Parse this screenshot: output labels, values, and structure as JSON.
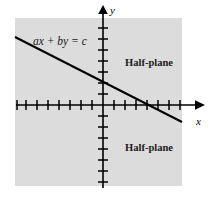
{
  "figure": {
    "type": "math-diagram",
    "background_color": "#ffffff",
    "shaded_color": "#dcdcdc",
    "ink_color": "#000000"
  },
  "labels": {
    "equation": "ax + by = c",
    "x_axis": "x",
    "y_axis": "y",
    "half_plane_upper": "Half-plane",
    "half_plane_lower": "Half-plane"
  },
  "chart_data": {
    "type": "line",
    "title": "",
    "xlabel": "x",
    "ylabel": "y",
    "grid": false,
    "legend": "none",
    "xlim": [
      -8,
      7.5
    ],
    "ylim": [
      -8,
      8
    ],
    "origin_px": [
      103,
      105
    ],
    "tick_spacing_px": 11,
    "x_ticks_left": 8,
    "x_ticks_right": 7,
    "y_ticks_up": 7,
    "y_ticks_down": 7,
    "shaded_region_px": {
      "x": 15,
      "y": 18,
      "width": 167,
      "height": 168
    },
    "series": [
      {
        "name": "ax + by = c",
        "points_px": [
          [
            15,
            37
          ],
          [
            182,
            122
          ]
        ],
        "annotation": "ax + by = c"
      }
    ],
    "annotations": [
      {
        "text": "Half-plane",
        "px": [
          149,
          62
        ]
      },
      {
        "text": "Half-plane",
        "px": [
          149,
          147
        ]
      },
      {
        "text": "ax + by = c",
        "px": [
          62,
          41
        ]
      }
    ]
  }
}
